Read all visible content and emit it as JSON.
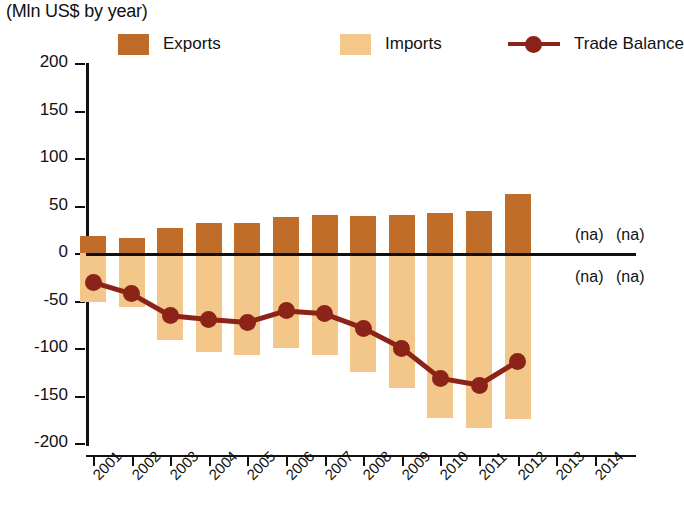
{
  "title": "Exports, Imports and Trade Balance",
  "subtitle": "(Mln US$ by year)",
  "legend": {
    "exports_label": "Exports",
    "imports_label": "Imports",
    "balance_label": "Trade Balance"
  },
  "colors": {
    "exports": "#C06D29",
    "imports": "#F3C78A",
    "balance": "#8C2318",
    "axis": "#111111"
  },
  "na_labels": {
    "top_2013": "(na)",
    "top_2014": "(na)",
    "bottom_2013": "(na)",
    "bottom_2014": "(na)"
  },
  "chart_data": {
    "type": "bar",
    "title": "Exports, Imports and Trade Balance",
    "subtitle": "(Mln US$ by year)",
    "xlabel": "",
    "ylabel": "Mln US$",
    "ylim": [
      -200,
      200
    ],
    "yticks": [
      200,
      150,
      100,
      50,
      0,
      -50,
      -100,
      -150,
      -200
    ],
    "ytick_labels": [
      "200",
      "150",
      "100",
      "50",
      "0",
      "-50",
      "-100",
      "-150",
      "-200"
    ],
    "grid": false,
    "legend_position": "top",
    "categories": [
      "2001",
      "2002",
      "2003",
      "2004",
      "2005",
      "2006",
      "2007",
      "2008",
      "2009",
      "2010",
      "2011",
      "2012",
      "2013",
      "2014"
    ],
    "series": [
      {
        "name": "Exports",
        "type": "bar",
        "color": "#C06D29",
        "values": [
          18,
          16,
          26,
          32,
          32,
          38,
          40,
          39,
          40,
          42,
          44,
          62,
          null,
          null
        ]
      },
      {
        "name": "Imports",
        "type": "bar",
        "color": "#F3C78A",
        "note": "plotted as negative (downward) bars",
        "values": [
          -52,
          -57,
          -92,
          -104,
          -107,
          -100,
          -107,
          -125,
          -142,
          -174,
          -184,
          -175,
          null,
          null
        ]
      },
      {
        "name": "Trade Balance",
        "type": "line",
        "color": "#8C2318",
        "values": [
          -31,
          -43,
          -66,
          -70,
          -73,
          -61,
          -64,
          -79,
          -100,
          -132,
          -139,
          -114,
          null,
          null
        ]
      }
    ]
  }
}
